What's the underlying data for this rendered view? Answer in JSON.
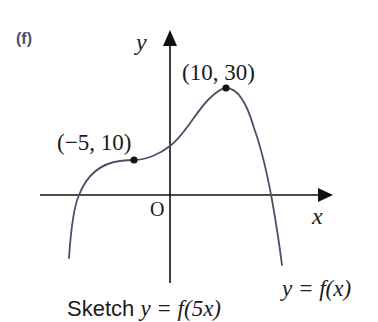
{
  "part_label": "(f)",
  "axes": {
    "x_label": "x",
    "y_label": "y",
    "origin_label": "O"
  },
  "points": [
    {
      "label": "(10, 30)",
      "x": 10,
      "y": 30,
      "type": "maximum"
    },
    {
      "label": "(−5, 10)",
      "x": -5,
      "y": 10,
      "type": "stationary-inflection"
    }
  ],
  "curve_label": "y = f(x)",
  "caption": {
    "prefix": "Sketch ",
    "math": "y = f(5x)"
  },
  "colors": {
    "curve": "#4a5068",
    "axes": "#111111",
    "part_label": "#4b4f6e"
  }
}
